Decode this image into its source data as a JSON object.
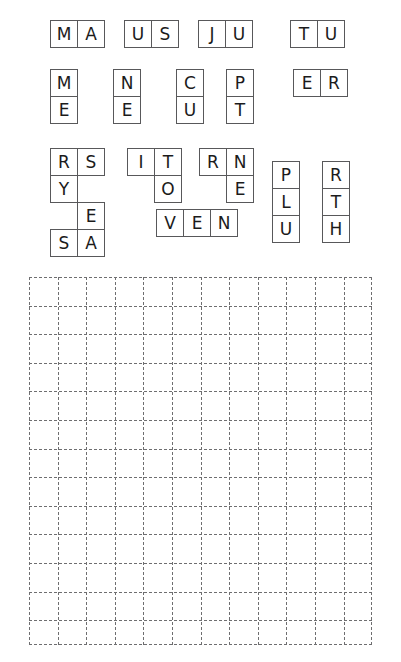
{
  "puzzle": {
    "kind": "letter-tile-placement-puzzle",
    "tile_size_px": 28,
    "pieces": [
      {
        "name": "piece-maus-ju-tu-row",
        "letters": "MA",
        "cells": [
          {
            "letter": "M",
            "col": 0,
            "row": 0
          },
          {
            "letter": "A",
            "col": 1,
            "row": 0
          }
        ],
        "x": 50,
        "y": 20
      },
      {
        "name": "piece-us",
        "letters": "US",
        "cells": [
          {
            "letter": "U",
            "col": 0,
            "row": 0
          },
          {
            "letter": "S",
            "col": 1,
            "row": 0
          }
        ],
        "x": 124,
        "y": 20
      },
      {
        "name": "piece-ju",
        "letters": "JU",
        "cells": [
          {
            "letter": "J",
            "col": 0,
            "row": 0
          },
          {
            "letter": "U",
            "col": 1,
            "row": 0
          }
        ],
        "x": 198,
        "y": 20
      },
      {
        "name": "piece-tu",
        "letters": "TU",
        "cells": [
          {
            "letter": "T",
            "col": 0,
            "row": 0
          },
          {
            "letter": "U",
            "col": 1,
            "row": 0
          }
        ],
        "x": 290,
        "y": 20
      },
      {
        "name": "piece-me",
        "letters": "ME",
        "cells": [
          {
            "letter": "M",
            "col": 0,
            "row": 0
          },
          {
            "letter": "E",
            "col": 0,
            "row": 1
          }
        ],
        "x": 50,
        "y": 69
      },
      {
        "name": "piece-ne",
        "letters": "NE",
        "cells": [
          {
            "letter": "N",
            "col": 0,
            "row": 0
          },
          {
            "letter": "E",
            "col": 0,
            "row": 1
          }
        ],
        "x": 113,
        "y": 69
      },
      {
        "name": "piece-cu",
        "letters": "CU",
        "cells": [
          {
            "letter": "C",
            "col": 0,
            "row": 0
          },
          {
            "letter": "U",
            "col": 0,
            "row": 1
          }
        ],
        "x": 176,
        "y": 69
      },
      {
        "name": "piece-pt",
        "letters": "PT",
        "cells": [
          {
            "letter": "P",
            "col": 0,
            "row": 0
          },
          {
            "letter": "T",
            "col": 0,
            "row": 1
          }
        ],
        "x": 226,
        "y": 69
      },
      {
        "name": "piece-er",
        "letters": "ER",
        "cells": [
          {
            "letter": "E",
            "col": 0,
            "row": 0
          },
          {
            "letter": "R",
            "col": 1,
            "row": 0
          }
        ],
        "x": 293,
        "y": 69
      },
      {
        "name": "piece-rs-y-e-sa",
        "letters": "RSYESA",
        "cells": [
          {
            "letter": "R",
            "col": 0,
            "row": 0
          },
          {
            "letter": "S",
            "col": 1,
            "row": 0
          },
          {
            "letter": "Y",
            "col": 0,
            "row": 1
          },
          {
            "letter": "E",
            "col": 1,
            "row": 2
          },
          {
            "letter": "S",
            "col": 0,
            "row": 3
          },
          {
            "letter": "A",
            "col": 1,
            "row": 3
          }
        ],
        "x": 50,
        "y": 148
      },
      {
        "name": "piece-it-o",
        "letters": "ITO",
        "cells": [
          {
            "letter": "I",
            "col": 0,
            "row": 0
          },
          {
            "letter": "T",
            "col": 1,
            "row": 0
          },
          {
            "letter": "O",
            "col": 1,
            "row": 1
          }
        ],
        "x": 127,
        "y": 148
      },
      {
        "name": "piece-rn-e",
        "letters": "RNE",
        "cells": [
          {
            "letter": "R",
            "col": 0,
            "row": 0
          },
          {
            "letter": "N",
            "col": 1,
            "row": 0
          },
          {
            "letter": "E",
            "col": 1,
            "row": 1
          }
        ],
        "x": 199,
        "y": 148
      },
      {
        "name": "piece-ven",
        "letters": "VEN",
        "cells": [
          {
            "letter": "V",
            "col": 0,
            "row": 0
          },
          {
            "letter": "E",
            "col": 1,
            "row": 0
          },
          {
            "letter": "N",
            "col": 2,
            "row": 0
          }
        ],
        "x": 156,
        "y": 209
      },
      {
        "name": "piece-plu",
        "letters": "PLU",
        "cells": [
          {
            "letter": "P",
            "col": 0,
            "row": 0
          },
          {
            "letter": "L",
            "col": 0,
            "row": 1
          },
          {
            "letter": "U",
            "col": 0,
            "row": 2
          }
        ],
        "x": 272,
        "y": 161
      },
      {
        "name": "piece-rth",
        "letters": "RTH",
        "cells": [
          {
            "letter": "R",
            "col": 0,
            "row": 0
          },
          {
            "letter": "T",
            "col": 0,
            "row": 1
          },
          {
            "letter": "H",
            "col": 0,
            "row": 2
          }
        ],
        "x": 322,
        "y": 161
      }
    ],
    "grid": {
      "name": "answer-grid",
      "columns": 12,
      "rows": 12.5,
      "cell_size_px": 28.6,
      "left": 29,
      "top": 277,
      "width": 343,
      "height": 368,
      "line_style": "dashed",
      "line_color": "#6e6e70",
      "cells": []
    }
  }
}
